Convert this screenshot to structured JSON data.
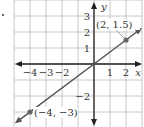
{
  "chart_data": {
    "type": "line",
    "title": "",
    "xlabel": "x",
    "ylabel": "y",
    "xlim": [
      -5,
      3
    ],
    "ylim": [
      -4,
      4
    ],
    "grid": true,
    "x_ticks": [
      {
        "value": -4,
        "label": "−4"
      },
      {
        "value": -3,
        "label": "−3"
      },
      {
        "value": -2,
        "label": "−2"
      },
      {
        "value": 1,
        "label": "1"
      },
      {
        "value": 2,
        "label": "2"
      }
    ],
    "y_ticks": [
      {
        "value": 3,
        "label": "3"
      },
      {
        "value": 2,
        "label": "2"
      },
      {
        "value": 1,
        "label": "1"
      },
      {
        "value": -2,
        "label": "−2"
      }
    ],
    "series": [
      {
        "name": "line",
        "equation": "y = 0.75x",
        "x": [
          -4,
          0,
          2
        ],
        "y": [
          -3,
          0,
          1.5
        ]
      }
    ],
    "points": [
      {
        "x": 2,
        "y": 1.5,
        "label": "(2, 1.5)"
      },
      {
        "x": -4,
        "y": -3,
        "label": "(−4, −3)"
      }
    ],
    "colors": {
      "grid": "#c8c8c8",
      "axis": "#222222",
      "line": "#555555",
      "point": "#666666",
      "text": "#333333"
    }
  }
}
